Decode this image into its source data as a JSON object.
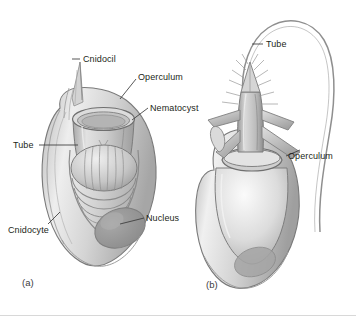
{
  "figure": {
    "background_color": "#ffffff",
    "ink_color": "#231f20",
    "line_color": "#6e6e6e",
    "fill_light": "#f2f2f2",
    "fill_mid": "#c9c9c9",
    "fill_dark": "#8e8e8e",
    "fill_nucleus": "#9a9a9a"
  },
  "labels": {
    "cnidocil": "Cnidocil",
    "operculum_a": "Operculum",
    "nematocyst": "Nematocyst",
    "tube_a": "Tube",
    "cnidocyte": "Cnidocyte",
    "nucleus": "Nucleus",
    "tube_b": "Tube",
    "operculum_b": "Operculum"
  },
  "panels": {
    "a": "(a)",
    "b": "(b)"
  },
  "icon_names": {
    "leader_line": "leader-line-icon",
    "cnidocil_spike": "cnidocil-spike-icon",
    "capsule": "nematocyst-capsule-icon",
    "coiled_tube": "coiled-tube-icon",
    "nucleus_blob": "nucleus-icon",
    "everted_shaft": "everted-shaft-icon",
    "barbs": "barb-spines-icon",
    "thread": "discharged-thread-icon"
  }
}
